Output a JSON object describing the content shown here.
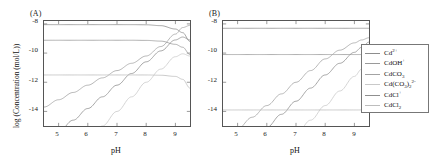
{
  "figure": {
    "panels": [
      {
        "tag": "(A)"
      },
      {
        "tag": "(B)"
      }
    ]
  },
  "axes": {
    "xlabel": "pH",
    "ylabel": "log (Concentration (mol/L))",
    "xticks": [
      "5",
      "6",
      "7",
      "8",
      "9"
    ],
    "yticks": [
      "-8",
      "-10",
      "-12",
      "-14"
    ],
    "xlim": [
      4.5,
      9.5
    ],
    "ylim": [
      -15.0,
      -7.8
    ]
  },
  "legend": {
    "items": [
      {
        "label": "Cd2+",
        "html": "Cd<sup>2+</sup>",
        "color": "#8d8d8d"
      },
      {
        "label": "CdOH+",
        "html": "CdOH<sup>+</sup>",
        "color": "#9a9a9a"
      },
      {
        "label": "CdCO3",
        "html": "CdCO<sub>3</sub>",
        "color": "#a3a3a3"
      },
      {
        "label": "Cd(CO3)2 2-",
        "html": "Cd(CO<sub>3</sub>)<sub>2</sub><sup>2-</sup>",
        "color": "#c9c9c9"
      },
      {
        "label": "CdCl+",
        "html": "CdCl<sup>+</sup>",
        "color": "#8f8f8f"
      },
      {
        "label": "CdCl2",
        "html": "CdCl<sub>2</sub>",
        "color": "#bdbdbd"
      }
    ]
  },
  "chart_data": [
    {
      "type": "line",
      "panel": "(A)",
      "title": "",
      "xlabel": "pH",
      "ylabel": "log (Concentration (mol/L))",
      "xlim": [
        4.5,
        9.5
      ],
      "ylim": [
        -15.0,
        -7.8
      ],
      "xticks": [
        5,
        6,
        7,
        8,
        9
      ],
      "yticks": [
        -8,
        -10,
        -12,
        -14
      ],
      "grid": false,
      "legend_position": "right-outside",
      "x": [
        4.5,
        5.0,
        5.5,
        6.0,
        6.5,
        7.0,
        7.5,
        8.0,
        8.5,
        9.0,
        9.25,
        9.5
      ],
      "series": [
        {
          "name": "Cd2+",
          "color": "#8d8d8d",
          "values": [
            -8.05,
            -8.05,
            -8.05,
            -8.05,
            -8.05,
            -8.05,
            -8.05,
            -8.06,
            -8.12,
            -8.35,
            -8.6,
            -9.2
          ]
        },
        {
          "name": "CdOH+",
          "color": "#9a9a9a",
          "values": [
            -9.12,
            -9.12,
            -9.12,
            -9.12,
            -9.12,
            -9.12,
            -9.12,
            -9.13,
            -9.18,
            -9.4,
            -9.6,
            -10.1
          ]
        },
        {
          "name": "CdCO3",
          "color": "#a3a3a3",
          "values": [
            -13.7,
            -13.2,
            -12.7,
            -12.2,
            -11.7,
            -11.2,
            -10.7,
            -10.2,
            -9.55,
            -8.7,
            -8.25,
            -8.1
          ]
        },
        {
          "name": "Cd(CO3)2 2-",
          "color": "#c9c9c9",
          "values": [
            -19.0,
            -18.0,
            -17.0,
            -16.0,
            -15.0,
            -14.0,
            -13.0,
            -12.0,
            -11.1,
            -10.25,
            -10.05,
            -10.2
          ]
        },
        {
          "name": "CdCl+",
          "color": "#8f8f8f",
          "values": [
            -16.2,
            -15.4,
            -14.6,
            -13.8,
            -13.0,
            -12.2,
            -11.4,
            -10.6,
            -9.85,
            -9.1,
            -8.9,
            -9.1
          ]
        },
        {
          "name": "CdCl2",
          "color": "#bdbdbd",
          "values": [
            -11.5,
            -11.5,
            -11.5,
            -11.5,
            -11.5,
            -11.5,
            -11.5,
            -11.5,
            -11.52,
            -11.6,
            -11.8,
            -12.4
          ]
        }
      ]
    },
    {
      "type": "line",
      "panel": "(B)",
      "title": "",
      "xlabel": "pH",
      "ylabel": "",
      "xlim": [
        4.5,
        9.5
      ],
      "ylim": [
        -15.0,
        -7.8
      ],
      "xticks": [
        5,
        6,
        7,
        8,
        9
      ],
      "yticks": [
        -8,
        -10,
        -12,
        -14
      ],
      "grid": false,
      "legend_position": "right-outside",
      "x": [
        4.5,
        5.0,
        5.5,
        6.0,
        6.5,
        7.0,
        7.5,
        8.0,
        8.5,
        9.0,
        9.25,
        9.5
      ],
      "series": [
        {
          "name": "Cd2+",
          "color": "#8d8d8d",
          "values": [
            -8.3,
            -8.3,
            -8.3,
            -8.3,
            -8.3,
            -8.3,
            -8.3,
            -8.3,
            -8.3,
            -8.3,
            -8.3,
            -8.3
          ]
        },
        {
          "name": "CdOH+",
          "color": "#9a9a9a",
          "values": [
            -10.1,
            -10.1,
            -10.1,
            -10.1,
            -10.1,
            -10.1,
            -10.1,
            -10.1,
            -10.1,
            -10.1,
            -10.1,
            -10.1
          ]
        },
        {
          "name": "CdCO3",
          "color": "#a3a3a3",
          "values": [
            -16.0,
            -15.2,
            -14.4,
            -13.6,
            -12.8,
            -12.0,
            -11.2,
            -10.4,
            -9.8,
            -9.3,
            -9.1,
            -8.95
          ]
        },
        {
          "name": "Cd(CO3)2 2-",
          "color": "#c9c9c9",
          "values": [
            -20.6,
            -19.6,
            -18.6,
            -17.6,
            -16.6,
            -15.6,
            -14.6,
            -13.6,
            -12.6,
            -11.6,
            -11.1,
            -10.6
          ]
        },
        {
          "name": "CdCl+",
          "color": "#8f8f8f",
          "values": [
            -17.8,
            -16.9,
            -16.0,
            -15.1,
            -14.2,
            -13.3,
            -12.4,
            -11.5,
            -10.7,
            -9.95,
            -9.6,
            -9.25
          ]
        },
        {
          "name": "CdCl2",
          "color": "#bdbdbd",
          "values": [
            -13.9,
            -13.9,
            -13.9,
            -13.9,
            -13.9,
            -13.9,
            -13.9,
            -13.9,
            -13.9,
            -13.9,
            -13.9,
            -13.9
          ]
        }
      ]
    }
  ]
}
